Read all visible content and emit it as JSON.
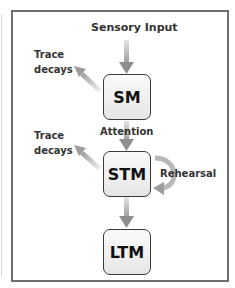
{
  "diagram": {
    "input_label": "Sensory Input",
    "boxes": [
      {
        "id": "sm",
        "label": "SM"
      },
      {
        "id": "stm",
        "label": "STM"
      },
      {
        "id": "ltm",
        "label": "LTM"
      }
    ],
    "edge_labels": {
      "attention": "Attention",
      "rehearsal": "Rehearsal",
      "trace_decays_1_line1": "Trace",
      "trace_decays_1_line2": "decays",
      "trace_decays_2_line1": "Trace",
      "trace_decays_2_line2": "decays"
    },
    "colors": {
      "frame": "#6e6e6e",
      "arrow": "#a8a8a8",
      "box_border": "#3a3a3a"
    }
  }
}
